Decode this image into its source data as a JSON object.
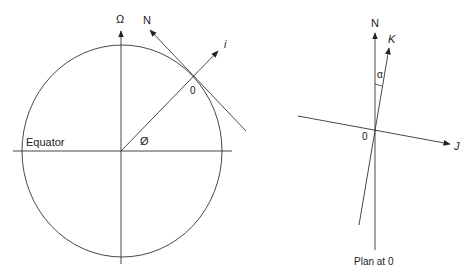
{
  "left_diagram": {
    "axis_label": "Ω",
    "normal_label": "N",
    "inclined_label": "i",
    "point_label": "0",
    "latitude_label": "Ø",
    "equator_label": "Equator"
  },
  "right_diagram": {
    "north_label": "N",
    "k_label": "K",
    "alpha_label": "α",
    "origin_label": "0",
    "j_label": "J",
    "caption": "Plan at 0"
  },
  "colors": {
    "line": "#333333",
    "text": "#222222"
  }
}
